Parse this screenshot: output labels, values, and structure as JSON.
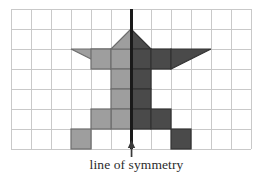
{
  "figure": {
    "caption": "line of symmetry",
    "grid": {
      "origin_x": 11,
      "origin_y": 9,
      "cell": 20,
      "cols": 12,
      "rows": 7,
      "line_color": "#c9c9c9",
      "line_width": 1.1,
      "background": "#ffffff"
    },
    "symmetry_line": {
      "label": "line of symmetry",
      "color": "#1a1a1a",
      "width": 2.6,
      "grid_column_index": 6,
      "x": 131,
      "y_top": 9,
      "y_bottom": 149
    },
    "arrow": {
      "name": "up-arrow",
      "color": "#3a3a3a",
      "x": 131,
      "tip_y": 140,
      "tail_y": 156,
      "head_width": 7,
      "head_height": 8,
      "shaft_width": 1.6
    },
    "colors": {
      "light_fill": "#9e9e9e",
      "light_stroke": "#6d6d6d",
      "dark_fill": "#4a4a4a",
      "dark_stroke": "#333333",
      "ink": "#2b2b2b"
    },
    "shape_cells_light": [
      {
        "col": 4,
        "row": 2,
        "kind": "square"
      },
      {
        "col": 5,
        "row": 2,
        "kind": "square"
      },
      {
        "col": 5,
        "row": 1,
        "kind": "triangle-apex-right"
      },
      {
        "col": 3,
        "row": 2,
        "kind": "triangle-wing-left"
      },
      {
        "col": 5,
        "row": 3,
        "kind": "square"
      },
      {
        "col": 5,
        "row": 4,
        "kind": "square"
      },
      {
        "col": 5,
        "row": 5,
        "kind": "square"
      },
      {
        "col": 4,
        "row": 5,
        "kind": "square"
      },
      {
        "col": 3,
        "row": 6,
        "kind": "square"
      }
    ],
    "shape_cells_dark": [
      {
        "col": 6,
        "row": 2,
        "kind": "square"
      },
      {
        "col": 7,
        "row": 2,
        "kind": "square"
      },
      {
        "col": 6,
        "row": 1,
        "kind": "triangle-apex-left"
      },
      {
        "col": 8,
        "row": 2,
        "kind": "triangle-wing-right"
      },
      {
        "col": 6,
        "row": 3,
        "kind": "square"
      },
      {
        "col": 6,
        "row": 4,
        "kind": "square"
      },
      {
        "col": 6,
        "row": 5,
        "kind": "square"
      },
      {
        "col": 7,
        "row": 5,
        "kind": "square"
      },
      {
        "col": 8,
        "row": 6,
        "kind": "square"
      }
    ]
  }
}
